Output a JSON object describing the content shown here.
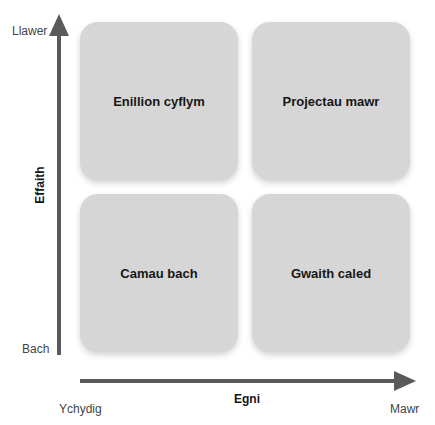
{
  "quadrants": {
    "top_left": "Enillion cyflym",
    "top_right": "Projectau mawr",
    "bottom_left": "Camau bach",
    "bottom_right": "Gwaith caled"
  },
  "y_axis": {
    "title": "Effaith",
    "high": "Llawer",
    "low": "Bach"
  },
  "x_axis": {
    "title": "Egni",
    "low": "Ychydig",
    "high": "Mawr"
  },
  "colors": {
    "card": "#d6d6d6",
    "arrow": "#5a5a5a"
  }
}
